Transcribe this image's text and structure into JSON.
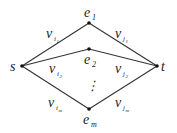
{
  "diagram": {
    "type": "graph",
    "nodes": [
      {
        "id": "s",
        "label": "s",
        "x": 22,
        "y": 66
      },
      {
        "id": "t",
        "label": "t",
        "x": 157,
        "y": 66
      },
      {
        "id": "e1",
        "label": "e",
        "sub": "1",
        "x": 89,
        "y": 23
      },
      {
        "id": "e2",
        "label": "e",
        "sub": "2",
        "x": 89,
        "y": 49
      },
      {
        "id": "em",
        "label": "e",
        "sub": "m",
        "x": 89,
        "y": 109
      }
    ],
    "edges": [
      {
        "from": "s",
        "to": "e1",
        "label": "v",
        "sub": "i",
        "subsub": "1"
      },
      {
        "from": "e1",
        "to": "t",
        "label": "v",
        "sub": "j",
        "subsub": "1"
      },
      {
        "from": "s",
        "to": "e2",
        "label": "v",
        "sub": "i",
        "subsub": "2"
      },
      {
        "from": "e2",
        "to": "t",
        "label": "v",
        "sub": "j",
        "subsub": "2"
      },
      {
        "from": "s",
        "to": "em",
        "label": "v",
        "sub": "i",
        "subsub": "m"
      },
      {
        "from": "em",
        "to": "t",
        "label": "v",
        "sub": "j",
        "subsub": "m"
      }
    ],
    "ellipsis": "⋮"
  }
}
